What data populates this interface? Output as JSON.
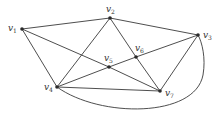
{
  "diagram": {
    "type": "graph",
    "colors": {
      "edge": "#3a3a3a",
      "node": "#2a2a2a",
      "label": "#333333"
    },
    "nodes": [
      {
        "id": "v1",
        "base": "v",
        "sub": "1",
        "x": 22,
        "y": 29,
        "lx": 8,
        "ly": 31
      },
      {
        "id": "v2",
        "base": "v",
        "sub": "2",
        "x": 110,
        "y": 18,
        "lx": 106,
        "ly": 12
      },
      {
        "id": "v3",
        "base": "v",
        "sub": "3",
        "x": 198,
        "y": 35,
        "lx": 203,
        "ly": 38
      },
      {
        "id": "v4",
        "base": "v",
        "sub": "4",
        "x": 57,
        "y": 87,
        "lx": 44,
        "ly": 90
      },
      {
        "id": "v5",
        "base": "v",
        "sub": "5",
        "x": 109,
        "y": 67,
        "lx": 104,
        "ly": 61
      },
      {
        "id": "v6",
        "base": "v",
        "sub": "6",
        "x": 136,
        "y": 57,
        "lx": 135,
        "ly": 51
      },
      {
        "id": "v7",
        "base": "v",
        "sub": "7",
        "x": 160,
        "y": 91,
        "lx": 165,
        "ly": 96
      }
    ],
    "edges": [
      [
        "v1",
        "v2"
      ],
      [
        "v1",
        "v4"
      ],
      [
        "v1",
        "v5"
      ],
      [
        "v5",
        "v7"
      ],
      [
        "v2",
        "v3"
      ],
      [
        "v2",
        "v4"
      ],
      [
        "v2",
        "v6"
      ],
      [
        "v6",
        "v7"
      ],
      [
        "v4",
        "v5"
      ],
      [
        "v5",
        "v6"
      ],
      [
        "v6",
        "v3"
      ],
      [
        "v3",
        "v7"
      ],
      [
        "v4",
        "v7"
      ]
    ],
    "curved_edges": [
      {
        "from": "v4",
        "to": "v3",
        "path": "M57,87 C100,118 195,118 203,75 C206,58 202,42 198,35"
      }
    ]
  }
}
